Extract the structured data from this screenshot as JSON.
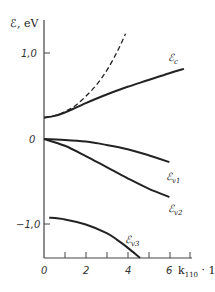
{
  "chart_data": {
    "type": "line",
    "title": "",
    "ylabel": "ℰ, eV",
    "xlabel": "k110 · 1",
    "xlim": [
      0,
      7
    ],
    "ylim": [
      -1.39,
      1.39
    ],
    "grid": false,
    "legend_position": "inline labels at curve ends",
    "x_ticks": [
      0,
      1,
      2,
      3,
      4,
      5,
      6,
      7
    ],
    "x_tick_labels": [
      "0",
      "2",
      "4",
      "6"
    ],
    "y_tick_labels": [
      "1.0",
      "0",
      "-1.0"
    ],
    "series": [
      {
        "name": "ℰc",
        "style": "solid",
        "x": [
          0,
          0.5,
          1,
          2,
          3,
          4,
          5,
          6,
          6.7
        ],
        "y": [
          0.25,
          0.27,
          0.31,
          0.42,
          0.52,
          0.61,
          0.69,
          0.77,
          0.82
        ]
      },
      {
        "name": "parabolic (dashed)",
        "style": "dashed",
        "x": [
          0,
          0.5,
          1,
          1.5,
          2,
          2.5,
          3,
          3.5,
          3.9
        ],
        "y": [
          0.25,
          0.27,
          0.32,
          0.39,
          0.5,
          0.63,
          0.8,
          1.02,
          1.23
        ]
      },
      {
        "name": "ℰv1",
        "style": "solid",
        "x": [
          0,
          1,
          2,
          3,
          4,
          5,
          6
        ],
        "y": [
          0.0,
          -0.01,
          -0.03,
          -0.07,
          -0.12,
          -0.19,
          -0.27
        ]
      },
      {
        "name": "ℰv2",
        "style": "solid",
        "x": [
          0,
          1,
          2,
          3,
          4,
          5,
          6
        ],
        "y": [
          0.0,
          -0.08,
          -0.2,
          -0.33,
          -0.46,
          -0.58,
          -0.68
        ]
      },
      {
        "name": "ℰv3",
        "style": "solid",
        "x": [
          0.25,
          1,
          2,
          3,
          3.5,
          4,
          4.6
        ],
        "y": [
          -0.92,
          -0.94,
          -1.0,
          -1.1,
          -1.18,
          -1.27,
          -1.39
        ]
      }
    ]
  },
  "labels": {
    "y_axis_title": "ℰ, eV",
    "x_axis_title_k": "k",
    "x_axis_title_sub": "110",
    "x_axis_title_tail": " · 1",
    "ytick_1": "1,0",
    "ytick_0": "0",
    "ytick_m1": "−1,0",
    "xtick_0": "0",
    "xtick_2": "2",
    "xtick_4": "4",
    "xtick_6": "6",
    "ec_main": "ℰ",
    "ec_sub": "c",
    "ev1_main": "ℰ",
    "ev1_sub": "v1",
    "ev2_main": "ℰ",
    "ev2_sub": "v2",
    "ev3_main": "ℰ",
    "ev3_sub": "v3"
  },
  "colors": {
    "line": "#222222",
    "axis": "#444444",
    "background": "#ffffff"
  }
}
